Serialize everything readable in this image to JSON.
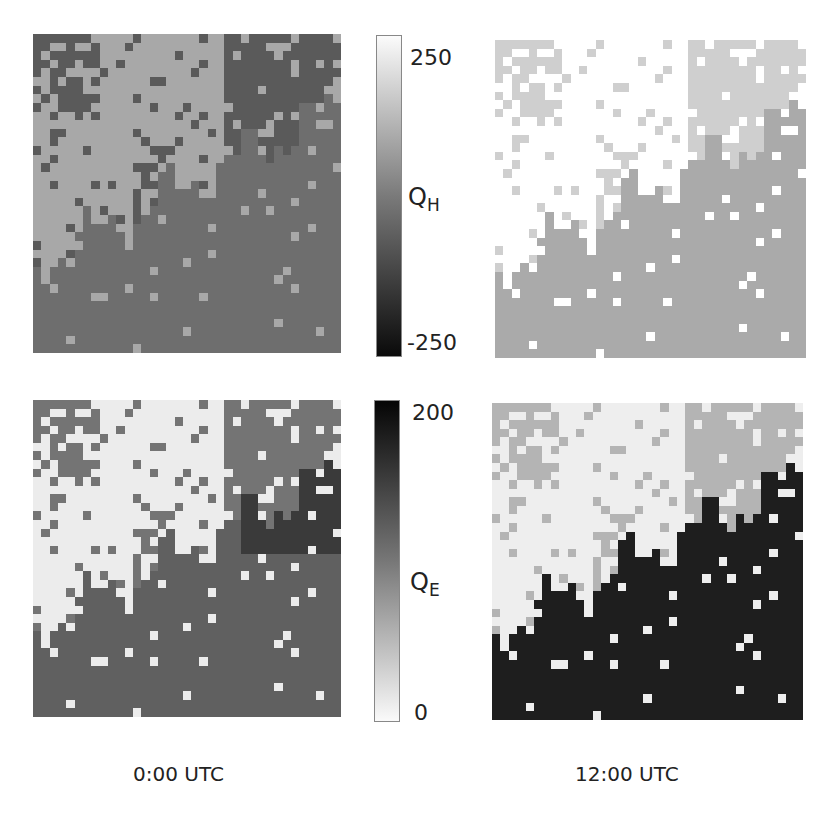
{
  "figure": {
    "colorbars": [
      {
        "id": "QH",
        "label": "Q",
        "subscript": "H",
        "max_label": "250",
        "min_label": "-250",
        "gradient": "light-top"
      },
      {
        "id": "QE",
        "label": "Q",
        "subscript": "E",
        "max_label": "200",
        "min_label": "0",
        "gradient": "dark-top"
      }
    ],
    "time_labels": [
      "0:00 UTC",
      "12:00 UTC"
    ],
    "caption": "Maps of (a, b) QH and (c, d) QE surface fluxes for 0:00 UTC and 12:00 UTC"
  },
  "chart_data": {
    "type": "heatmap",
    "title": "",
    "panels": [
      {
        "name": "QH 0:00 UTC",
        "colorbar": "QH",
        "range": [
          -250,
          250
        ],
        "dominant_values": [
          "~0 (light gray, land)",
          "~-50 (dark gray, urban)",
          "~-30 (mid gray, water)"
        ]
      },
      {
        "name": "QH 12:00 UTC",
        "colorbar": "QH",
        "range": [
          -250,
          250
        ],
        "dominant_values": [
          "~250 (white, urban)",
          "~150 (light gray)",
          "~30 (gray, water)"
        ]
      },
      {
        "name": "QE 0:00 UTC",
        "colorbar": "QE",
        "range": [
          0,
          200
        ],
        "dominant_values": [
          "~10 (near white)",
          "~110 (gray, water)",
          "~160 (dark)"
        ]
      },
      {
        "name": "QE 12:00 UTC",
        "colorbar": "QE",
        "range": [
          0,
          200
        ],
        "dominant_values": [
          "~10 (white)",
          "~60 (gray)",
          "~200 (black, water)"
        ]
      }
    ],
    "colorbar_ticks": {
      "QH": [
        -250,
        250
      ],
      "QE": [
        0,
        200
      ]
    },
    "xlabel": "",
    "ylabel": ""
  },
  "colors": {
    "tl": {
      "a": "#a8a8a8",
      "b": "#5a5a5a",
      "c": "#6e6e6e",
      "d": "#7a7a7a"
    },
    "tr": {
      "a": "#ffffff",
      "b": "#cfcfcf",
      "c": "#aaaaaa",
      "d": "#8e8e8e"
    },
    "bl": {
      "a": "#ececec",
      "b": "#747474",
      "c": "#606060",
      "d": "#3a3a3a"
    },
    "br": {
      "a": "#eeeeee",
      "b": "#b4b4b4",
      "c": "#1e1e1e",
      "d": "#808080"
    }
  }
}
